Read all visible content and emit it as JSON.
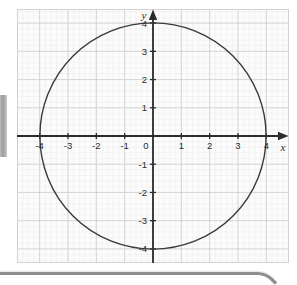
{
  "page": {
    "background_color": "#ffffff",
    "width": 297,
    "height": 285
  },
  "left_tab": {
    "name": "left-edge-tab",
    "color": "#9d9d9d"
  },
  "bottom_bar": {
    "name": "bottom-divider-bar",
    "color": "#8e8e8e"
  },
  "graph": {
    "title": "",
    "axis_color": "#2b2b2b",
    "curve_color": "#3a3a3a",
    "major_grid_color": "#d2d2d2",
    "minor_grid_color": "#ededed",
    "plot_background": "#fcfcfc",
    "x_axis_name": "x",
    "y_axis_name": "y",
    "x_tick_labels": [
      "-4",
      "-3",
      "-2",
      "-1",
      "0",
      "1",
      "2",
      "3",
      "4"
    ],
    "y_tick_labels_positive": [
      "4",
      "3",
      "2",
      "1"
    ],
    "y_tick_labels_negative": [
      "-1",
      "-2",
      "-3",
      "-4"
    ]
  },
  "chart_data": {
    "type": "line",
    "title": "",
    "subtitle": "",
    "xlabel": "x",
    "ylabel": "y",
    "xlim": [
      -4.8,
      4.8
    ],
    "ylim": [
      -4.5,
      4.5
    ],
    "xticks": [
      -4,
      -3,
      -2,
      -1,
      0,
      1,
      2,
      3,
      4
    ],
    "yticks": [
      -4,
      -3,
      -2,
      -1,
      1,
      2,
      3,
      4
    ],
    "xtick_labels": [
      "-4",
      "-3",
      "-2",
      "-1",
      "0",
      "1",
      "2",
      "3",
      "4"
    ],
    "ytick_labels": [
      "-4",
      "-3",
      "-2",
      "-1",
      "1",
      "2",
      "3",
      "4"
    ],
    "grid": true,
    "minor_grid": true,
    "minor_grid_subdivisions": 5,
    "legend": null,
    "legend_position": "none",
    "annotations": [],
    "series": [
      {
        "name": "circle x^2 + y^2 = 16",
        "shape": "circle",
        "center": [
          0,
          0
        ],
        "radius": 4,
        "x_intercepts": [
          -4,
          4
        ],
        "y_intercepts": [
          -4,
          4
        ],
        "color": "#3a3a3a",
        "linewidth": 1.4,
        "filled": false
      }
    ]
  }
}
